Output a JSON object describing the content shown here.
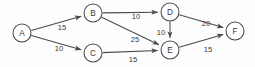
{
  "figure": {
    "background_color": "#fdfdfd",
    "stroke_color": "#4a4a4a",
    "text_color": "#3a3a3a",
    "node_fill": "#ffffff"
  },
  "chart_data": {
    "type": "diagram",
    "diagram_type": "weighted directed graph",
    "title": "",
    "directed": true,
    "nodes": [
      {
        "id": "A",
        "label": "A",
        "x": 22,
        "y": 33,
        "r": 9
      },
      {
        "id": "B",
        "label": "B",
        "x": 93,
        "y": 13,
        "r": 9
      },
      {
        "id": "C",
        "label": "C",
        "x": 93,
        "y": 53,
        "r": 9
      },
      {
        "id": "D",
        "label": "D",
        "x": 170,
        "y": 12,
        "r": 9
      },
      {
        "id": "E",
        "label": "E",
        "x": 170,
        "y": 50,
        "r": 9
      },
      {
        "id": "F",
        "label": "F",
        "x": 235,
        "y": 31,
        "r": 9
      }
    ],
    "edges": [
      {
        "from": "A",
        "to": "B",
        "weight": 15,
        "label": "15",
        "label_x": 62,
        "label_y": 27
      },
      {
        "from": "A",
        "to": "C",
        "weight": 10,
        "label": "10",
        "label_x": 59,
        "label_y": 48
      },
      {
        "from": "B",
        "to": "D",
        "weight": 10,
        "label": "10",
        "label_x": 136,
        "label_y": 16
      },
      {
        "from": "B",
        "to": "E",
        "weight": 25,
        "label": "25",
        "label_x": 135,
        "label_y": 39
      },
      {
        "from": "C",
        "to": "E",
        "weight": 15,
        "label": "15",
        "label_x": 133,
        "label_y": 59
      },
      {
        "from": "D",
        "to": "E",
        "weight": 10,
        "label": "10",
        "label_x": 161,
        "label_y": 32
      },
      {
        "from": "D",
        "to": "F",
        "weight": 20,
        "label": "20",
        "label_x": 206,
        "label_y": 23
      },
      {
        "from": "E",
        "to": "F",
        "weight": 15,
        "label": "15",
        "label_x": 208,
        "label_y": 49
      }
    ],
    "node_labels": [
      "A",
      "B",
      "C",
      "D",
      "E",
      "F"
    ],
    "weights": [
      15,
      10,
      10,
      25,
      15,
      10,
      20,
      15
    ]
  }
}
